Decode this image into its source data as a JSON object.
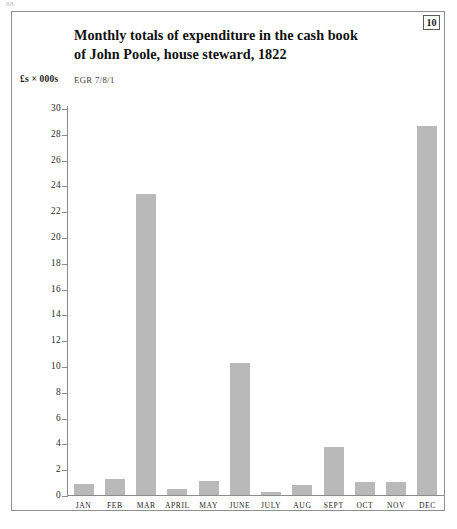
{
  "page": {
    "running_page_number": "88",
    "figure_number": "10"
  },
  "figure": {
    "title_line1": "Monthly totals of expenditure in the cash book",
    "title_line2": "of John Poole, house steward, 1822",
    "unit_label": "£s × 000s",
    "source_reference": "EGR 7/8/1"
  },
  "chart_data": {
    "type": "bar",
    "title": "Monthly totals of expenditure in the cash book of John Poole, house steward, 1822",
    "xlabel": "",
    "ylabel": "£s × 000s",
    "ylim": [
      0,
      30
    ],
    "ytick_step": 2,
    "grid": false,
    "legend": null,
    "bar_color": "#b9b9b9",
    "axis_color": "#8b8b8b",
    "categories": [
      "JAN",
      "FEB",
      "MAR",
      "APRIL",
      "MAY",
      "JUNE",
      "JULY",
      "AUG",
      "SEPT",
      "OCT",
      "NOV",
      "DEC"
    ],
    "values": [
      0.85,
      1.25,
      23.3,
      0.45,
      1.05,
      10.25,
      0.25,
      0.8,
      3.7,
      1.0,
      1.0,
      28.6
    ],
    "ytick_labels": [
      "30",
      "28",
      "26",
      "24",
      "22",
      "20",
      "18",
      "16",
      "14",
      "12",
      "10",
      "8",
      "6",
      "4",
      "2",
      "0"
    ],
    "ytick_values": [
      30,
      28,
      26,
      24,
      22,
      20,
      18,
      16,
      14,
      12,
      10,
      8,
      6,
      4,
      2,
      0
    ]
  }
}
